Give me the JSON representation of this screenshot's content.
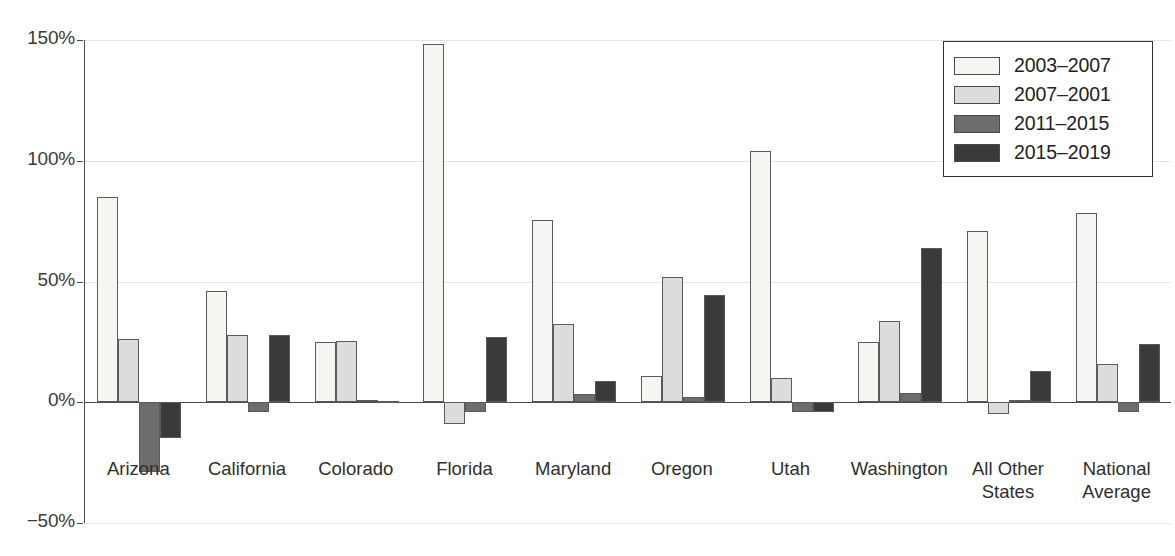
{
  "chart_data": {
    "type": "bar",
    "title": "",
    "subtitle": "",
    "xlabel": "",
    "ylabel": "",
    "ylim": [
      -50,
      150
    ],
    "y_ticks": [
      150,
      100,
      50,
      0,
      -50
    ],
    "y_tick_labels": [
      "150%",
      "100%",
      "50%",
      "0%",
      "−50%"
    ],
    "grid": true,
    "legend_position": "top-right",
    "value_format": "percent",
    "categories": [
      "Arizona",
      "California",
      "Colorado",
      "Florida",
      "Maryland",
      "Oregon",
      "Utah",
      "Washington",
      "All Other\nStates",
      "National\nAverage"
    ],
    "series": [
      {
        "name": "2003–2007",
        "color": "#f5f5f2",
        "values": [
          85,
          46,
          25,
          148.5,
          75.5,
          11,
          104,
          25,
          71,
          78.5
        ]
      },
      {
        "name": "2007–2001",
        "color": "#dcdcdc",
        "values": [
          26,
          28,
          25.5,
          -9,
          32.5,
          52,
          10,
          33.5,
          -5,
          16
        ]
      },
      {
        "name": "2011–2015",
        "color": "#6d6d6d",
        "values": [
          -29,
          -4,
          1,
          -4,
          3.5,
          2,
          -4,
          4,
          1,
          -4
        ]
      },
      {
        "name": "2015–2019",
        "color": "#3a3a3a",
        "values": [
          -15,
          28,
          0.5,
          27,
          9,
          44.5,
          -4,
          64,
          13,
          24
        ]
      }
    ]
  },
  "legend": {
    "entries": [
      {
        "label": "2003–2007"
      },
      {
        "label": "2007–2001"
      },
      {
        "label": "2011–2015"
      },
      {
        "label": "2015–2019"
      }
    ]
  }
}
